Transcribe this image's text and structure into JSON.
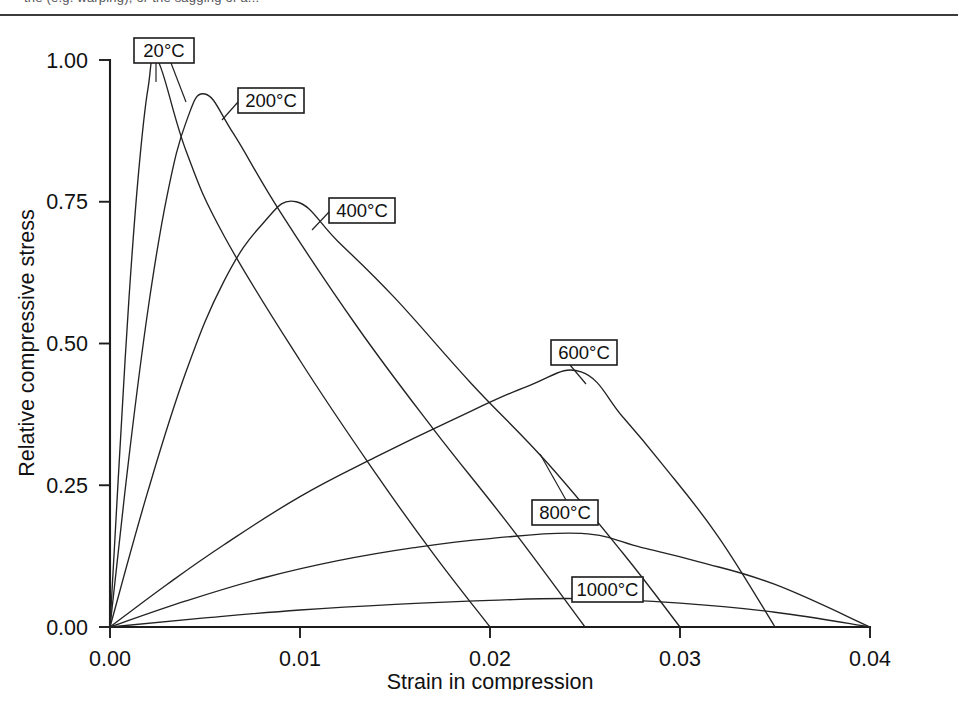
{
  "page": {
    "clipped_top_text": "the (e.g. warping), or the sagging of a...",
    "bottom_scan_noise": "· ·· · ··· · ·· ··· · ···· · ·· ··· ·· · ··· ·· · ···· · ·· ··· · ·· ···· · ·· · ··· ··"
  },
  "chart_data": {
    "type": "line",
    "title": "",
    "xlabel": "Strain in compression",
    "ylabel": "Relative compressive stress",
    "xlim": [
      0.0,
      0.04
    ],
    "ylim": [
      0.0,
      1.0
    ],
    "xticks": [
      "0.00",
      "0.01",
      "0.02",
      "0.03",
      "0.04"
    ],
    "xtick_values": [
      0.0,
      0.01,
      0.02,
      0.03,
      0.04
    ],
    "yticks": [
      "0.00",
      "0.25",
      "0.50",
      "0.75",
      "1.00"
    ],
    "ytick_values": [
      0.0,
      0.25,
      0.5,
      0.75,
      1.0
    ],
    "grid": false,
    "legend_position": "inline-callouts",
    "line_color": "#232323",
    "series": [
      {
        "name": "20°C",
        "peak_strain": 0.0025,
        "peak_stress": 1.0,
        "end_strain": 0.02,
        "x": [
          0.0,
          0.0005,
          0.001,
          0.0015,
          0.002,
          0.0025,
          0.004,
          0.006,
          0.01,
          0.014,
          0.017,
          0.02
        ],
        "y": [
          0.0,
          0.3,
          0.58,
          0.8,
          0.95,
          1.0,
          0.84,
          0.69,
          0.47,
          0.27,
          0.13,
          0.0
        ]
      },
      {
        "name": "200°C",
        "peak_strain": 0.005,
        "peak_stress": 0.94,
        "end_strain": 0.025,
        "x": [
          0.0,
          0.001,
          0.002,
          0.003,
          0.004,
          0.005,
          0.0065,
          0.009,
          0.013,
          0.017,
          0.021,
          0.025
        ],
        "y": [
          0.0,
          0.3,
          0.56,
          0.76,
          0.89,
          0.94,
          0.87,
          0.73,
          0.53,
          0.35,
          0.18,
          0.0
        ]
      },
      {
        "name": "400°C",
        "peak_strain": 0.0098,
        "peak_stress": 0.75,
        "end_strain": 0.03,
        "x": [
          0.0,
          0.002,
          0.004,
          0.006,
          0.008,
          0.0098,
          0.012,
          0.015,
          0.019,
          0.023,
          0.027,
          0.03
        ],
        "y": [
          0.0,
          0.24,
          0.45,
          0.61,
          0.71,
          0.75,
          0.68,
          0.58,
          0.43,
          0.29,
          0.13,
          0.0
        ]
      },
      {
        "name": "600°C",
        "peak_strain": 0.0248,
        "peak_stress": 0.45,
        "end_strain": 0.035,
        "x": [
          0.0,
          0.003,
          0.006,
          0.01,
          0.014,
          0.018,
          0.022,
          0.0248,
          0.027,
          0.029,
          0.032,
          0.035
        ],
        "y": [
          0.0,
          0.075,
          0.145,
          0.23,
          0.3,
          0.365,
          0.425,
          0.45,
          0.37,
          0.29,
          0.16,
          0.0
        ]
      },
      {
        "name": "800°C",
        "peak_strain": 0.0248,
        "peak_stress": 0.165,
        "end_strain": 0.04,
        "x": [
          0.0,
          0.004,
          0.008,
          0.012,
          0.016,
          0.02,
          0.0248,
          0.028,
          0.031,
          0.035,
          0.04
        ],
        "y": [
          0.0,
          0.046,
          0.086,
          0.117,
          0.14,
          0.156,
          0.165,
          0.14,
          0.115,
          0.075,
          0.0
        ]
      },
      {
        "name": "1000°C",
        "peak_strain": 0.0248,
        "peak_stress": 0.05,
        "end_strain": 0.04,
        "x": [
          0.0,
          0.005,
          0.01,
          0.015,
          0.02,
          0.0248,
          0.03,
          0.035,
          0.04
        ],
        "y": [
          0.0,
          0.016,
          0.03,
          0.04,
          0.047,
          0.05,
          0.042,
          0.026,
          0.0
        ]
      }
    ],
    "callouts": [
      {
        "label": "20°C",
        "box_x": 134,
        "box_y": 22,
        "box_w": 60,
        "box_h": 25
      },
      {
        "label": "200°C",
        "box_x": 238,
        "box_y": 72,
        "box_w": 66,
        "box_h": 25
      },
      {
        "label": "400°C",
        "box_x": 329,
        "box_y": 182,
        "box_w": 66,
        "box_h": 25
      },
      {
        "label": "600°C",
        "box_x": 551,
        "box_y": 324,
        "box_w": 66,
        "box_h": 25
      },
      {
        "label": "800°C",
        "box_x": 532,
        "box_y": 484,
        "box_w": 66,
        "box_h": 25
      },
      {
        "label": "1000°C",
        "box_x": 572,
        "box_y": 561,
        "box_w": 71,
        "box_h": 25
      }
    ]
  }
}
